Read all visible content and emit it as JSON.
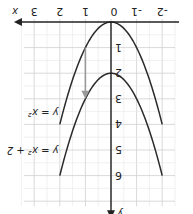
{
  "chart_data": {
    "type": "line",
    "title": "",
    "xlabel": "x",
    "ylabel": "y",
    "orientation_note": "rendered rotated 180 degrees",
    "xlim": [
      -2.5,
      3.5
    ],
    "ylim": [
      0,
      7
    ],
    "x_ticks": [
      "-2",
      "-1",
      "0",
      "1",
      "2",
      "3"
    ],
    "y_ticks": [
      "1",
      "2",
      "3",
      "4",
      "5",
      "6"
    ],
    "series": [
      {
        "name": "y = x²",
        "x": [
          -2,
          -1,
          0,
          1,
          2
        ],
        "y": [
          4,
          1,
          0,
          1,
          4
        ]
      },
      {
        "name": "y = x² + 2",
        "x": [
          -2,
          -1,
          0,
          1,
          2
        ],
        "y": [
          6,
          3,
          2,
          3,
          6
        ]
      }
    ],
    "annotations": [
      {
        "type": "arrow",
        "from": [
          1,
          1
        ],
        "to": [
          1,
          3
        ],
        "color": "#999999",
        "meaning": "vertical shift up 2"
      }
    ],
    "grid": true,
    "colors": {
      "curve": "#2a2a2a",
      "arrow": "#999999",
      "axis": "#222222"
    }
  },
  "labels": {
    "x_axis": "x",
    "y_axis": "y",
    "curve1": "y = x²",
    "curve2": "y = x² + 2",
    "ticks_x": [
      "-2",
      "-1",
      "0",
      "1",
      "2",
      "3"
    ],
    "ticks_y": [
      "1",
      "2",
      "3",
      "4",
      "5",
      "6"
    ]
  }
}
